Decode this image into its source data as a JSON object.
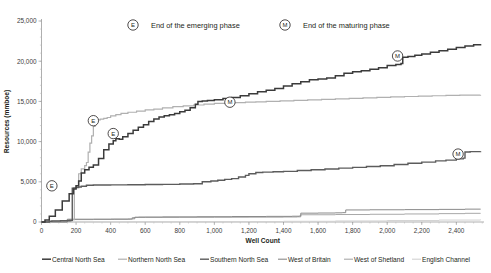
{
  "chart_data": {
    "type": "line",
    "title": "",
    "xlabel": "Well Count",
    "ylabel": "Resources (mmboe)",
    "xlim": [
      0,
      2560
    ],
    "ylim": [
      0,
      25000
    ],
    "xticks": [
      0,
      200,
      400,
      600,
      800,
      1000,
      1200,
      1400,
      1600,
      1800,
      2000,
      2200,
      2400
    ],
    "xticklabels": [
      "0",
      "200",
      "400",
      "600",
      "800",
      "1,000",
      "1,200",
      "1,400",
      "1,600",
      "1,800",
      "2,000",
      "2,200",
      "2,400"
    ],
    "yticks": [
      0,
      5000,
      10000,
      15000,
      20000,
      25000
    ],
    "yticklabels": [
      "0",
      "5,000",
      "10,000",
      "15,000",
      "20,000",
      "25,000"
    ],
    "grid": false,
    "legend_position": "bottom",
    "series": [
      {
        "name": "Central North Sea",
        "color": "#3b3b3b",
        "width": 1.5,
        "points": [
          [
            0,
            0
          ],
          [
            20,
            250
          ],
          [
            45,
            700
          ],
          [
            80,
            1500
          ],
          [
            120,
            2600
          ],
          [
            160,
            3500
          ],
          [
            185,
            4100
          ],
          [
            200,
            4500
          ],
          [
            215,
            5100
          ],
          [
            230,
            6100
          ],
          [
            250,
            6500
          ],
          [
            275,
            6800
          ],
          [
            300,
            7100
          ],
          [
            330,
            7900
          ],
          [
            360,
            9000
          ],
          [
            390,
            9700
          ],
          [
            415,
            10100
          ],
          [
            430,
            10350
          ],
          [
            450,
            10300
          ],
          [
            470,
            10600
          ],
          [
            500,
            11000
          ],
          [
            530,
            11400
          ],
          [
            560,
            11800
          ],
          [
            590,
            12100
          ],
          [
            620,
            12500
          ],
          [
            650,
            12800
          ],
          [
            680,
            13050
          ],
          [
            710,
            13200
          ],
          [
            740,
            13350
          ],
          [
            770,
            13500
          ],
          [
            800,
            13700
          ],
          [
            830,
            13900
          ],
          [
            860,
            14200
          ],
          [
            890,
            14650
          ],
          [
            905,
            15000
          ],
          [
            930,
            15050
          ],
          [
            960,
            15100
          ],
          [
            1000,
            15200
          ],
          [
            1050,
            15350
          ],
          [
            1100,
            15500
          ],
          [
            1150,
            15700
          ],
          [
            1200,
            15950
          ],
          [
            1250,
            16200
          ],
          [
            1300,
            16400
          ],
          [
            1350,
            16600
          ],
          [
            1400,
            16900
          ],
          [
            1450,
            17200
          ],
          [
            1500,
            17450
          ],
          [
            1550,
            17700
          ],
          [
            1600,
            17800
          ],
          [
            1650,
            17900
          ],
          [
            1700,
            18200
          ],
          [
            1750,
            18500
          ],
          [
            1800,
            18700
          ],
          [
            1850,
            18800
          ],
          [
            1900,
            19000
          ],
          [
            1950,
            19200
          ],
          [
            2000,
            19450
          ],
          [
            2050,
            19600
          ],
          [
            2080,
            19700
          ],
          [
            2090,
            20500
          ],
          [
            2120,
            20600
          ],
          [
            2160,
            20750
          ],
          [
            2200,
            20900
          ],
          [
            2250,
            21100
          ],
          [
            2300,
            21300
          ],
          [
            2350,
            21500
          ],
          [
            2400,
            21700
          ],
          [
            2450,
            21900
          ],
          [
            2500,
            22050
          ],
          [
            2540,
            22150
          ]
        ]
      },
      {
        "name": "Northern North Sea",
        "color": "#b0b0b0",
        "width": 1.2,
        "points": [
          [
            0,
            0
          ],
          [
            60,
            100
          ],
          [
            120,
            180
          ],
          [
            170,
            250
          ],
          [
            180,
            300
          ],
          [
            190,
            4200
          ],
          [
            200,
            4500
          ],
          [
            215,
            6000
          ],
          [
            230,
            6600
          ],
          [
            250,
            7000
          ],
          [
            260,
            7400
          ],
          [
            270,
            8700
          ],
          [
            280,
            9800
          ],
          [
            290,
            10700
          ],
          [
            300,
            11900
          ],
          [
            310,
            12400
          ],
          [
            320,
            12700
          ],
          [
            340,
            12800
          ],
          [
            360,
            12900
          ],
          [
            380,
            13000
          ],
          [
            400,
            13200
          ],
          [
            430,
            13350
          ],
          [
            460,
            13500
          ],
          [
            500,
            13650
          ],
          [
            550,
            13800
          ],
          [
            600,
            13950
          ],
          [
            650,
            14050
          ],
          [
            700,
            14200
          ],
          [
            760,
            14350
          ],
          [
            820,
            14450
          ],
          [
            880,
            14550
          ],
          [
            940,
            14650
          ],
          [
            1000,
            14750
          ],
          [
            1060,
            14800
          ],
          [
            1120,
            14850
          ],
          [
            1180,
            14900
          ],
          [
            1240,
            14950
          ],
          [
            1300,
            15000
          ],
          [
            1380,
            15060
          ],
          [
            1460,
            15120
          ],
          [
            1540,
            15180
          ],
          [
            1620,
            15250
          ],
          [
            1700,
            15320
          ],
          [
            1780,
            15380
          ],
          [
            1860,
            15440
          ],
          [
            1940,
            15500
          ],
          [
            2020,
            15560
          ],
          [
            2100,
            15610
          ],
          [
            2180,
            15660
          ],
          [
            2260,
            15700
          ],
          [
            2340,
            15740
          ],
          [
            2420,
            15770
          ],
          [
            2540,
            15800
          ]
        ]
      },
      {
        "name": "Southern North Sea",
        "color": "#5c5c5c",
        "width": 1.4,
        "points": [
          [
            0,
            0
          ],
          [
            45,
            90
          ],
          [
            60,
            120
          ],
          [
            110,
            150
          ],
          [
            165,
            180
          ],
          [
            175,
            200
          ],
          [
            178,
            4200
          ],
          [
            185,
            4250
          ],
          [
            200,
            4300
          ],
          [
            215,
            4350
          ],
          [
            230,
            4450
          ],
          [
            260,
            4580
          ],
          [
            300,
            4600
          ],
          [
            400,
            4620
          ],
          [
            500,
            4640
          ],
          [
            600,
            4660
          ],
          [
            700,
            4680
          ],
          [
            800,
            4720
          ],
          [
            880,
            4760
          ],
          [
            930,
            5000
          ],
          [
            980,
            5100
          ],
          [
            1020,
            5200
          ],
          [
            1060,
            5300
          ],
          [
            1100,
            5400
          ],
          [
            1140,
            5600
          ],
          [
            1180,
            5800
          ],
          [
            1200,
            6000
          ],
          [
            1240,
            6150
          ],
          [
            1280,
            6200
          ],
          [
            1340,
            6250
          ],
          [
            1400,
            6300
          ],
          [
            1480,
            6400
          ],
          [
            1560,
            6500
          ],
          [
            1640,
            6600
          ],
          [
            1720,
            6700
          ],
          [
            1800,
            6800
          ],
          [
            1880,
            6900
          ],
          [
            1960,
            7000
          ],
          [
            2040,
            7150
          ],
          [
            2120,
            7300
          ],
          [
            2200,
            7450
          ],
          [
            2280,
            7600
          ],
          [
            2340,
            7700
          ],
          [
            2400,
            7850
          ],
          [
            2440,
            7950
          ],
          [
            2450,
            8700
          ],
          [
            2480,
            8750
          ],
          [
            2540,
            8800
          ]
        ]
      },
      {
        "name": "West of Britain",
        "color": "#8a8a8a",
        "width": 1.0,
        "points": [
          [
            0,
            0
          ],
          [
            140,
            0
          ],
          [
            150,
            350
          ],
          [
            300,
            360
          ],
          [
            400,
            370
          ],
          [
            500,
            380
          ],
          [
            520,
            400
          ],
          [
            540,
            600
          ],
          [
            560,
            620
          ],
          [
            700,
            640
          ],
          [
            900,
            660
          ],
          [
            1100,
            680
          ],
          [
            1300,
            700
          ],
          [
            1450,
            720
          ],
          [
            1490,
            740
          ],
          [
            1500,
            1100
          ],
          [
            1600,
            1120
          ],
          [
            1700,
            1140
          ],
          [
            1740,
            1160
          ],
          [
            1760,
            1500
          ],
          [
            1900,
            1520
          ],
          [
            2100,
            1540
          ],
          [
            2300,
            1570
          ],
          [
            2450,
            1600
          ],
          [
            2540,
            1620
          ]
        ]
      },
      {
        "name": "West of Shetland",
        "color": "#a8a8a8",
        "width": 1.0,
        "points": [
          [
            0,
            0
          ],
          [
            140,
            0
          ],
          [
            148,
            300
          ],
          [
            300,
            310
          ],
          [
            420,
            320
          ],
          [
            500,
            330
          ],
          [
            515,
            340
          ],
          [
            525,
            560
          ],
          [
            600,
            570
          ],
          [
            800,
            580
          ],
          [
            1000,
            590
          ],
          [
            1200,
            600
          ],
          [
            1400,
            620
          ],
          [
            1480,
            640
          ],
          [
            1500,
            900
          ],
          [
            1700,
            930
          ],
          [
            1900,
            960
          ],
          [
            2100,
            1000
          ],
          [
            2300,
            1040
          ],
          [
            2450,
            1080
          ],
          [
            2540,
            1100
          ]
        ]
      },
      {
        "name": "English Channel",
        "color": "#d2d2d2",
        "width": 1.0,
        "points": [
          [
            0,
            0
          ],
          [
            200,
            10
          ],
          [
            500,
            25
          ],
          [
            800,
            40
          ],
          [
            1100,
            60
          ],
          [
            1400,
            90
          ],
          [
            1700,
            130
          ],
          [
            2000,
            180
          ],
          [
            2300,
            240
          ],
          [
            2540,
            300
          ]
        ]
      }
    ],
    "annotations": [
      {
        "label": "E",
        "x": 60,
        "y": 4500,
        "series": "Southern North Sea"
      },
      {
        "label": "E",
        "x": 300,
        "y": 12600,
        "series": "Northern North Sea"
      },
      {
        "label": "E",
        "x": 415,
        "y": 11000,
        "series": "Central North Sea"
      },
      {
        "label": "M",
        "x": 1090,
        "y": 14900,
        "series": "Northern North Sea"
      },
      {
        "label": "M",
        "x": 2060,
        "y": 20650,
        "series": "Central North Sea"
      },
      {
        "label": "M",
        "x": 2410,
        "y": 8450,
        "series": "Southern North Sea"
      }
    ],
    "key_legend": [
      {
        "marker": "E",
        "text": "End of the emerging phase"
      },
      {
        "marker": "M",
        "text": "End of the maturing phase"
      }
    ]
  }
}
